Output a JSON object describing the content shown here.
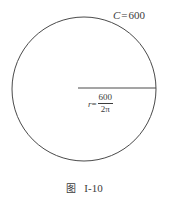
{
  "figure": {
    "caption_cjk": "图",
    "caption_number": "I-10",
    "circle": {
      "center_x": 84,
      "center_y": 89,
      "radius": 72,
      "stroke_color": "#4a4a4a",
      "stroke_width": 1,
      "fill": "none"
    },
    "radius_line": {
      "x1": 78,
      "y1": 88,
      "x2": 156,
      "y2": 88,
      "stroke_color": "#4a4a4a",
      "stroke_width": 1
    },
    "labels": {
      "circumference": {
        "symbol": "C",
        "equals": "=",
        "value": "600",
        "full": "C = 600"
      },
      "radius": {
        "symbol": "r",
        "equals": "=",
        "numerator": "600",
        "denominator": "2π",
        "full": "r = 600 / 2π"
      }
    }
  },
  "colors": {
    "background": "#ffffff",
    "ink": "#3c3c3c",
    "stroke": "#4a4a4a"
  }
}
